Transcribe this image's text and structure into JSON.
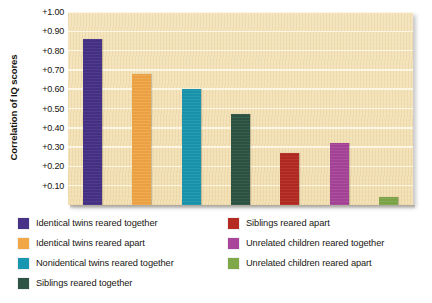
{
  "chart_data": {
    "type": "bar",
    "title": "",
    "xlabel": "",
    "ylabel": "Correlation of IQ scores",
    "ylim": [
      0,
      1.0
    ],
    "grid": true,
    "legend_position": "below-plot-two-columns",
    "ytick_labels": [
      "+1.00",
      "+0.90",
      "+0.80",
      "+0.70",
      "+0.60",
      "+0.50",
      "+0.40",
      "+0.30",
      "+0.20",
      "+0.10"
    ],
    "ytick_values": [
      1.0,
      0.9,
      0.8,
      0.7,
      0.6,
      0.5,
      0.4,
      0.3,
      0.2,
      0.1
    ],
    "categories": [
      "Identical twins reared together",
      "Identical twins reared apart",
      "Nonidentical twins reared together",
      "Siblings reared together",
      "Siblings reared apart",
      "Unrelated children reared together",
      "Unrelated children reared apart"
    ],
    "values": [
      0.86,
      0.68,
      0.6,
      0.47,
      0.27,
      0.32,
      0.04
    ],
    "colors": [
      "#473287",
      "#f2a747",
      "#1a97b0",
      "#2d5444",
      "#b52b22",
      "#a9459a",
      "#7fa84a"
    ]
  },
  "axis": {
    "y_title": "Correlation of IQ scores"
  },
  "legend": {
    "left_column": [
      {
        "label": "Identical twins reared together",
        "color": "#473287"
      },
      {
        "label": "Identical twins reared apart",
        "color": "#f2a747"
      },
      {
        "label": "Nonidentical twins reared together",
        "color": "#1a97b0"
      },
      {
        "label": "Siblings reared together",
        "color": "#2d5444"
      }
    ],
    "right_column": [
      {
        "label": "Siblings reared apart",
        "color": "#b52b22"
      },
      {
        "label": "Unrelated children reared together",
        "color": "#a9459a"
      },
      {
        "label": "Unrelated children reared apart",
        "color": "#7fa84a"
      }
    ]
  },
  "style": {
    "plot_background": "#f1ddb0",
    "gridline_color": "#fdf7e6"
  }
}
